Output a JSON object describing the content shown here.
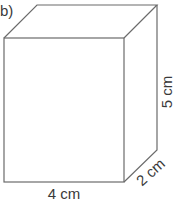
{
  "figure": {
    "part_label": "b)",
    "shape": "cuboid",
    "dimensions": {
      "width": "4 cm",
      "height": "5 cm",
      "depth": "2 cm"
    },
    "colors": {
      "edge": "#6b6b6b",
      "text": "#3a3a3a",
      "background": "#ffffff"
    }
  }
}
